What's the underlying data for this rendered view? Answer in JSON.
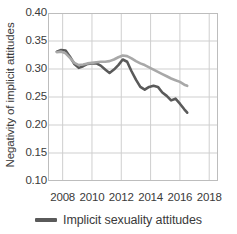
{
  "chart_data": {
    "type": "line",
    "title": "",
    "xlabel": "",
    "ylabel": "Negativity of implicit attitudes",
    "xlim": [
      2007.0,
      2018.6
    ],
    "ylim": [
      0.1,
      0.4
    ],
    "xticks": [
      2008,
      2010,
      2012,
      2014,
      2016,
      2018
    ],
    "xtick_labels": [
      "2008",
      "2010",
      "2012",
      "2014",
      "2016",
      "2018"
    ],
    "yticks": [
      0.1,
      0.15,
      0.2,
      0.25,
      0.3,
      0.35,
      0.4
    ],
    "ytick_labels": [
      "0.10",
      "0.15",
      "0.20",
      "0.25",
      "0.30",
      "0.35",
      "0.40"
    ],
    "grid": true,
    "grid_color": "#cfcfcf",
    "frame_color": "#bdbdbd",
    "legend_position": "bottom-center",
    "legend": [
      "Implicit sexuality attitudes"
    ],
    "series": [
      {
        "name": "Implicit sexuality attitudes",
        "color": "#5a5a5a",
        "width": 2.6,
        "in_legend": true,
        "x": [
          2007.6,
          2007.9,
          2008.2,
          2008.5,
          2008.8,
          2009.1,
          2009.4,
          2009.7,
          2010.0,
          2010.3,
          2010.6,
          2010.9,
          2011.2,
          2011.5,
          2011.8,
          2012.1,
          2012.4,
          2012.7,
          2013.0,
          2013.3,
          2013.6,
          2013.9,
          2014.2,
          2014.5,
          2014.8,
          2015.1,
          2015.4,
          2015.7,
          2016.0,
          2016.3,
          2016.5
        ],
        "y": [
          0.331,
          0.334,
          0.333,
          0.322,
          0.309,
          0.302,
          0.305,
          0.309,
          0.31,
          0.31,
          0.306,
          0.299,
          0.293,
          0.299,
          0.307,
          0.317,
          0.313,
          0.296,
          0.281,
          0.268,
          0.263,
          0.268,
          0.27,
          0.268,
          0.258,
          0.252,
          0.244,
          0.247,
          0.238,
          0.228,
          0.222
        ]
      },
      {
        "name": "Comparison attitudes",
        "color": "#a8a8a8",
        "width": 2.6,
        "in_legend": false,
        "x": [
          2007.6,
          2007.9,
          2008.2,
          2008.5,
          2008.8,
          2009.1,
          2009.4,
          2009.7,
          2010.0,
          2010.3,
          2010.6,
          2010.9,
          2011.2,
          2011.5,
          2011.8,
          2012.1,
          2012.4,
          2012.7,
          2013.0,
          2013.3,
          2013.6,
          2013.9,
          2014.2,
          2014.5,
          2014.8,
          2015.1,
          2015.4,
          2015.7,
          2016.0,
          2016.3,
          2016.5
        ],
        "y": [
          0.33,
          0.331,
          0.328,
          0.32,
          0.311,
          0.307,
          0.308,
          0.31,
          0.311,
          0.312,
          0.313,
          0.313,
          0.314,
          0.317,
          0.321,
          0.324,
          0.323,
          0.319,
          0.314,
          0.31,
          0.307,
          0.303,
          0.299,
          0.295,
          0.291,
          0.287,
          0.283,
          0.28,
          0.277,
          0.272,
          0.27
        ]
      }
    ]
  }
}
